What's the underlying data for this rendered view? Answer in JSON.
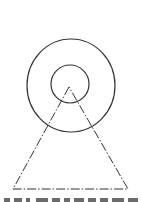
{
  "figure": {
    "stroke_color": "#333333",
    "outer_circle": {
      "cx": 71,
      "cy": 85.5,
      "rx": 44,
      "ry": 46.5
    },
    "inner_circle": {
      "cx": 70,
      "cy": 84,
      "r": 19
    },
    "triangle": {
      "apex": [
        69,
        87
      ],
      "base_left": [
        13,
        189
      ],
      "base_right": [
        128,
        189
      ],
      "line_style": "dash-dot"
    }
  },
  "caption": {
    "visible": "partially cropped, illegible",
    "fragments_x": [
      [
        4,
        10
      ],
      [
        14,
        22
      ],
      [
        26,
        30
      ],
      [
        36,
        48
      ],
      [
        52,
        60
      ],
      [
        64,
        70
      ],
      [
        74,
        84
      ],
      [
        88,
        96
      ],
      [
        100,
        108
      ],
      [
        112,
        124
      ],
      [
        128,
        138
      ]
    ]
  }
}
